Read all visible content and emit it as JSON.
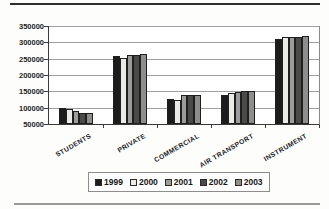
{
  "page": {
    "background": "#fdfdfc",
    "top_rule_color": "#2f2f2f",
    "bottom_rule_color": "#9a9a9a"
  },
  "chart_data": {
    "type": "bar",
    "title": "",
    "categories": [
      "STUDENTS",
      "PRIVATE",
      "COMMERCIAL",
      "AIR TRANSPORT",
      "INSTRUMENT"
    ],
    "series": [
      {
        "name": "1999",
        "color": "#1c1c1c",
        "values": [
          100000,
          259000,
          127000,
          139000,
          310000
        ]
      },
      {
        "name": "2000",
        "color": "#ebebe8",
        "values": [
          95000,
          252000,
          122000,
          145000,
          316000
        ]
      },
      {
        "name": "2001",
        "color": "#9c9c9a",
        "values": [
          89000,
          262000,
          138000,
          148000,
          316000
        ]
      },
      {
        "name": "2002",
        "color": "#4a4a48",
        "values": [
          85000,
          262000,
          140000,
          150000,
          316000
        ]
      },
      {
        "name": "2003",
        "color": "#8e8e8c",
        "values": [
          83000,
          265000,
          138000,
          151000,
          318000
        ]
      }
    ],
    "ylim": [
      50000,
      350000
    ],
    "ytick_step": 50000,
    "ytick_labels": [
      "350000",
      "300000",
      "250000",
      "200000",
      "150000",
      "100000",
      "50000"
    ],
    "grid": "horizontal",
    "legend_position": "bottom",
    "xlabel": "",
    "ylabel": ""
  }
}
